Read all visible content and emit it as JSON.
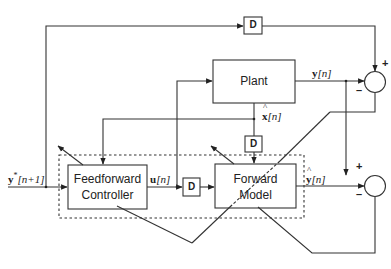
{
  "diagram": {
    "type": "block-diagram",
    "blocks": {
      "plant": {
        "label": "Plant"
      },
      "feedforward_controller": {
        "label_line1": "Feedforward",
        "label_line2": "Controller"
      },
      "forward_model": {
        "label_line1": "Forward",
        "label_line2": "Model"
      },
      "delay_top": {
        "label": "D"
      },
      "delay_middle": {
        "label": "D"
      },
      "delay_state": {
        "label": "D"
      }
    },
    "signals": {
      "reference": {
        "base": "y",
        "sup": "*",
        "idx": "[n+1]"
      },
      "control": {
        "base": "u",
        "idx": "[n]"
      },
      "output": {
        "base": "y",
        "idx": "[n]"
      },
      "state_estimate": {
        "base": "x",
        "hat": "^",
        "idx": "[n]"
      },
      "predicted_output": {
        "base": "y",
        "hat": "^",
        "idx": "[n]"
      }
    },
    "summing_junctions": {
      "top": {
        "plus": "+",
        "minus": "–"
      },
      "bottom": {
        "plus": "+",
        "minus": "–"
      }
    }
  }
}
